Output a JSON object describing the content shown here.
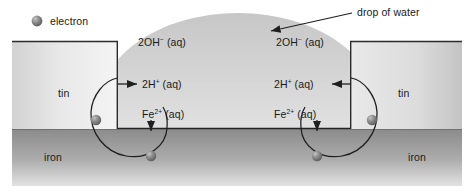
{
  "diagram": {
    "background_color": "#ffffff",
    "legend": {
      "marker_name": "electron-sphere",
      "label": "electron"
    },
    "callout": {
      "label": "drop of water",
      "arrow_name": "drop-of-water-leader-arrow"
    },
    "materials": [
      {
        "id": "tin-left",
        "label": "tin",
        "x": 58,
        "y": 88
      },
      {
        "id": "tin-right",
        "label": "tin",
        "x": 398,
        "y": 88
      },
      {
        "id": "iron-left",
        "label": "iron",
        "x": 44,
        "y": 152
      },
      {
        "id": "iron-right",
        "label": "iron",
        "x": 408,
        "y": 152
      }
    ],
    "species": [
      {
        "id": "hydroxide-left",
        "base": "2OH",
        "charge": "−",
        "state": " (aq)",
        "x": 138,
        "y": 37
      },
      {
        "id": "hydroxide-right",
        "base": "2OH",
        "charge": "−",
        "state": " (aq)",
        "x": 276,
        "y": 37
      },
      {
        "id": "proton-left",
        "base": "2H",
        "charge": "+",
        "state": " (aq)",
        "x": 142,
        "y": 79
      },
      {
        "id": "proton-right",
        "base": "2H",
        "charge": "+",
        "state": " (aq)",
        "x": 274,
        "y": 79
      },
      {
        "id": "iron-ion-left",
        "base": "Fe",
        "charge": "2+",
        "state": " (aq)",
        "x": 142,
        "y": 113
      },
      {
        "id": "iron-ion-right",
        "base": "Fe",
        "charge": "2+",
        "state": " (aq)",
        "x": 274,
        "y": 113
      }
    ],
    "colors": {
      "tin_light": "#f2f2f2",
      "tin_dark": "#b9b9b9",
      "iron_light": "#8e8e8e",
      "iron_dark": "#d8d8d8",
      "water": "#c9c9c9",
      "outline": "#2b2b2b",
      "electron": "#7a7a7a",
      "text": "#1a1a1a"
    }
  }
}
